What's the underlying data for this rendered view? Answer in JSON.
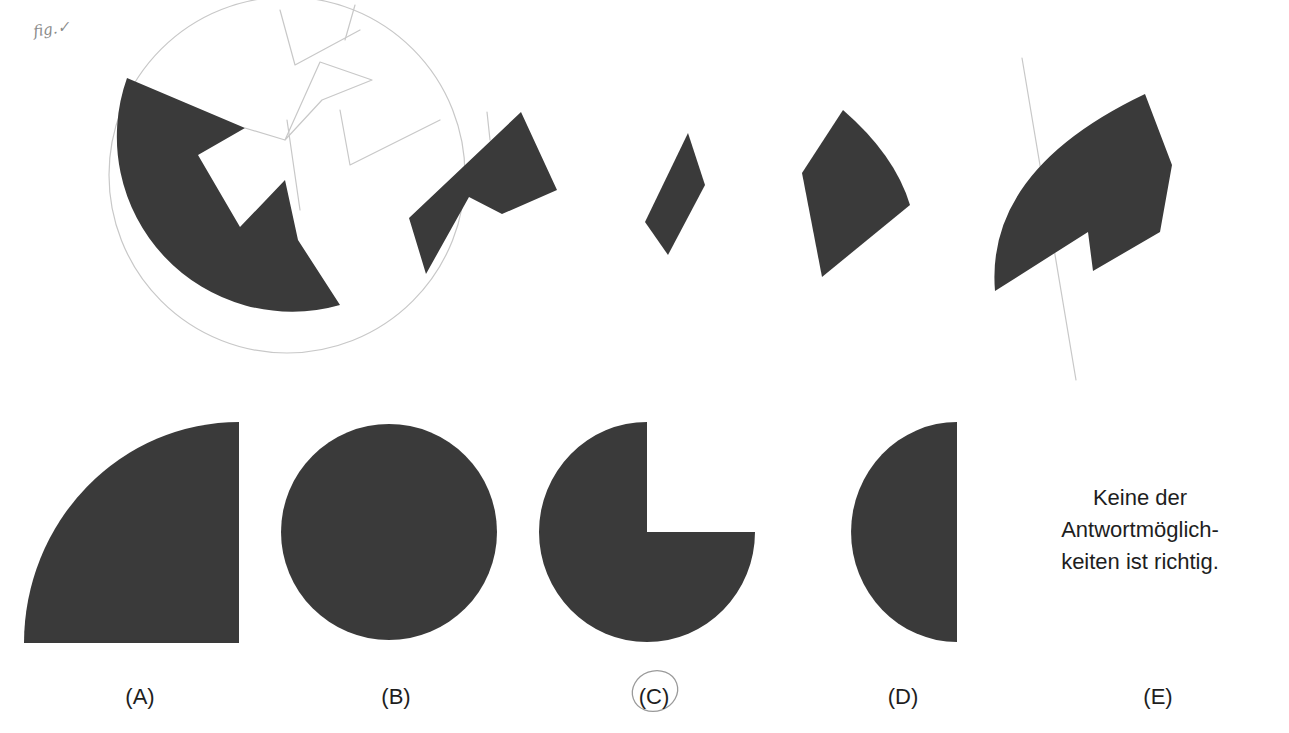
{
  "question": {
    "header_text_cutoff": "(question text cut off at top edge of page)",
    "annotation_handwritten": "fig.✓",
    "task_figure": {
      "description": "A circle cut into pieces; shaded pieces shown separately must be mentally assembled",
      "pieces": [
        {
          "id": "piece-1",
          "label": "circle-with-cutouts"
        },
        {
          "id": "piece-2",
          "label": "notched-quadrilateral"
        },
        {
          "id": "piece-3",
          "label": "small-rhombus"
        },
        {
          "id": "piece-4",
          "label": "curved-kite"
        },
        {
          "id": "piece-5",
          "label": "notched-arc-sector"
        }
      ]
    }
  },
  "options": [
    {
      "id": "A",
      "label": "(A)",
      "shape": "quarter-circle"
    },
    {
      "id": "B",
      "label": "(B)",
      "shape": "full-circle"
    },
    {
      "id": "C",
      "label": "(C)",
      "shape": "three-quarter-circle",
      "circled": true
    },
    {
      "id": "D",
      "label": "(D)",
      "shape": "half-circle"
    },
    {
      "id": "E",
      "label": "(E)",
      "text_lines": [
        "Keine der",
        "Antwortmöglich-",
        "keiten ist richtig."
      ]
    }
  ],
  "colors": {
    "shape_fill": "#3a3a3a",
    "pencil": "#c8c8c8",
    "text": "#1e1e1e",
    "background": "#ffffff"
  }
}
